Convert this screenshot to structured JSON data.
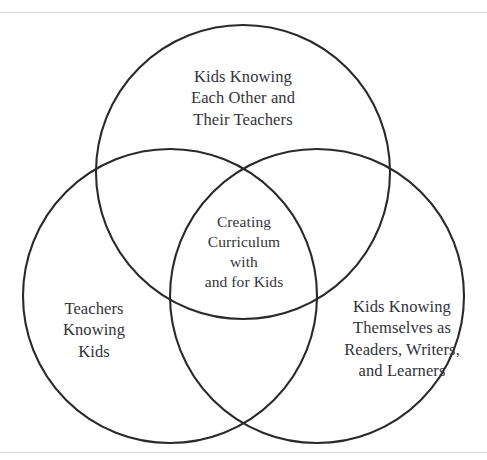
{
  "figure": {
    "type": "venn-diagram-3-circle",
    "background_color": "#ffffff",
    "stroke_color": "#2a2a2d",
    "text_color": "#33333a",
    "rule_color": "#d9d9dc"
  },
  "venn": {
    "top_circle": {
      "name": "kids-knowing-each-other-and-their-teachers",
      "label": "Kids Knowing\nEach Other and\nTheir Teachers",
      "cx": 243,
      "cy": 172,
      "r": 147
    },
    "left_circle": {
      "name": "teachers-knowing-kids",
      "label": "Teachers\nKnowing\nKids",
      "cx": 170,
      "cy": 296,
      "r": 147
    },
    "right_circle": {
      "name": "kids-knowing-themselves",
      "label": "Kids Knowing\nThemselves as\nReaders, Writers,\nand Learners",
      "cx": 317,
      "cy": 296,
      "r": 147
    },
    "center_intersection": {
      "name": "creating-curriculum-with-and-for-kids",
      "label": "Creating\nCurriculum\nwith\nand for Kids"
    }
  }
}
